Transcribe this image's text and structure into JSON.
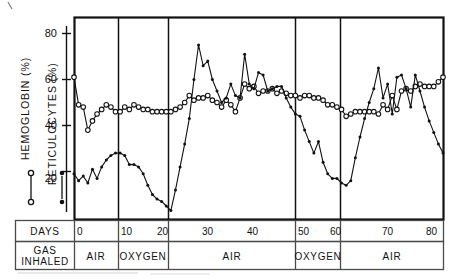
{
  "figure": {
    "axis_left_label": "HEMOGLOBIN  (%)",
    "axis_right_label": "RETICULOCYTES  (%)",
    "row_label_days": "DAYS",
    "row_label_gas_line1": "GAS",
    "row_label_gas_line2": "INHALED",
    "y_ticks": [
      "80",
      "60",
      "40",
      "20"
    ],
    "x_ticks": [
      "0",
      "10",
      "20",
      "30",
      "40",
      "50",
      "60",
      "70",
      "80"
    ],
    "phases": [
      "AIR",
      "OXYGEN",
      "AIR",
      "OXYGEN",
      "AIR"
    ],
    "legend": {
      "hemoglobin_marker": "open-circle",
      "reticulocytes_marker": "filled-circle"
    },
    "colors": {
      "ink": "#111111",
      "rule": "#4a4a4a",
      "paper": "#ffffff"
    }
  },
  "chart_data": {
    "type": "line",
    "title": "",
    "xlabel": "DAYS",
    "ylabel": "HEMOGLOBIN (%) / RETICULOCYTES (%)",
    "xlim": [
      -1,
      81
    ],
    "ylim": [
      0,
      90
    ],
    "ytick_values": [
      20,
      40,
      60,
      80
    ],
    "xtick_values": [
      0,
      10,
      20,
      30,
      40,
      50,
      60,
      70,
      80
    ],
    "grid": false,
    "legend_position": "left-margin",
    "phase_bands": [
      {
        "label": "AIR",
        "start": 0,
        "end": 10
      },
      {
        "label": "OXYGEN",
        "start": 10,
        "end": 21
      },
      {
        "label": "AIR",
        "start": 21,
        "end": 49
      },
      {
        "label": "OXYGEN",
        "start": 49,
        "end": 59
      },
      {
        "label": "AIR",
        "start": 59,
        "end": 80
      }
    ],
    "series": [
      {
        "name": "HEMOGLOBIN (%)",
        "marker": "open-circle",
        "x": [
          0,
          1,
          2,
          3,
          4,
          5,
          6,
          7,
          8,
          9,
          10,
          11,
          12,
          13,
          14,
          15,
          16,
          17,
          18,
          19,
          20,
          21,
          22,
          23,
          24,
          25,
          26,
          27,
          28,
          29,
          30,
          31,
          32,
          33,
          34,
          35,
          36,
          37,
          38,
          39,
          40,
          41,
          42,
          43,
          44,
          45,
          46,
          47,
          48,
          49,
          50,
          51,
          52,
          53,
          54,
          55,
          56,
          57,
          58,
          59,
          60,
          61,
          62,
          63,
          64,
          65,
          66,
          67,
          68,
          69,
          70,
          71,
          72,
          73,
          74,
          75,
          76,
          77,
          78,
          79,
          80
        ],
        "values": [
          61,
          49,
          48,
          38,
          42,
          45,
          47,
          49,
          48,
          46,
          46,
          48,
          47,
          49,
          48,
          47,
          47,
          46,
          46,
          46,
          46,
          46,
          47,
          48,
          50,
          53,
          51,
          52,
          52,
          53,
          51,
          50,
          48,
          51,
          49,
          46,
          52,
          58,
          56,
          57,
          54,
          55,
          55,
          56,
          54,
          55,
          54,
          53,
          53,
          52,
          53,
          53,
          52,
          52,
          51,
          49,
          49,
          48,
          47,
          44,
          45,
          46,
          46,
          46,
          46,
          46,
          45,
          49,
          47,
          53,
          47,
          55,
          56,
          55,
          57,
          58,
          57,
          57,
          57,
          59,
          61
        ]
      },
      {
        "name": "RETICULOCYTES (%)",
        "marker": "filled-circle",
        "x": [
          0,
          1,
          2,
          3,
          4,
          5,
          6,
          7,
          8,
          9,
          10,
          11,
          12,
          13,
          14,
          15,
          16,
          17,
          18,
          19,
          20,
          21,
          22,
          23,
          24,
          25,
          26,
          27,
          28,
          29,
          30,
          31,
          32,
          33,
          34,
          35,
          36,
          37,
          38,
          39,
          40,
          41,
          42,
          43,
          44,
          45,
          46,
          47,
          48,
          49,
          50,
          51,
          52,
          53,
          54,
          55,
          56,
          57,
          58,
          59,
          60,
          61,
          62,
          63,
          64,
          65,
          66,
          67,
          68,
          69,
          70,
          71,
          72,
          73,
          74,
          75,
          76,
          77,
          78,
          79,
          80
        ],
        "values": [
          19,
          16,
          18,
          15,
          21,
          17,
          22,
          25,
          27,
          28,
          28,
          27,
          23,
          23,
          22,
          19,
          14,
          10,
          8,
          7,
          5,
          3,
          12,
          22,
          32,
          43,
          60,
          75,
          66,
          68,
          60,
          55,
          50,
          52,
          58,
          53,
          52,
          71,
          58,
          56,
          63,
          62,
          55,
          56,
          57,
          57,
          52,
          48,
          45,
          44,
          38,
          33,
          28,
          33,
          24,
          19,
          17,
          17,
          15,
          14,
          16,
          26,
          35,
          43,
          50,
          56,
          65,
          52,
          58,
          45,
          61,
          62,
          56,
          48,
          62,
          55,
          48,
          42,
          37,
          32,
          28
        ]
      }
    ]
  }
}
